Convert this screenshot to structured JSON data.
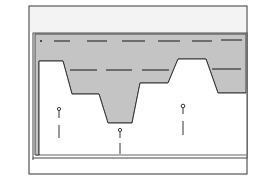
{
  "diagram": {
    "type": "cross-section-profile",
    "colors": {
      "background": "#ffffff",
      "frame_top_band": "#f3f3f3",
      "shaded_region": "#c4c4c4",
      "line": "#333333"
    },
    "dashed_lines": [
      {
        "name": "upper-dashed-line",
        "segments": 6
      },
      {
        "name": "middle-dashed-line-left",
        "segments": 3
      },
      {
        "name": "middle-dashed-line-right",
        "segments": 1
      }
    ],
    "markers": [
      {
        "name": "marker-left",
        "kind": "pin"
      },
      {
        "name": "marker-center",
        "kind": "pin"
      },
      {
        "name": "marker-right",
        "kind": "pin"
      }
    ]
  }
}
